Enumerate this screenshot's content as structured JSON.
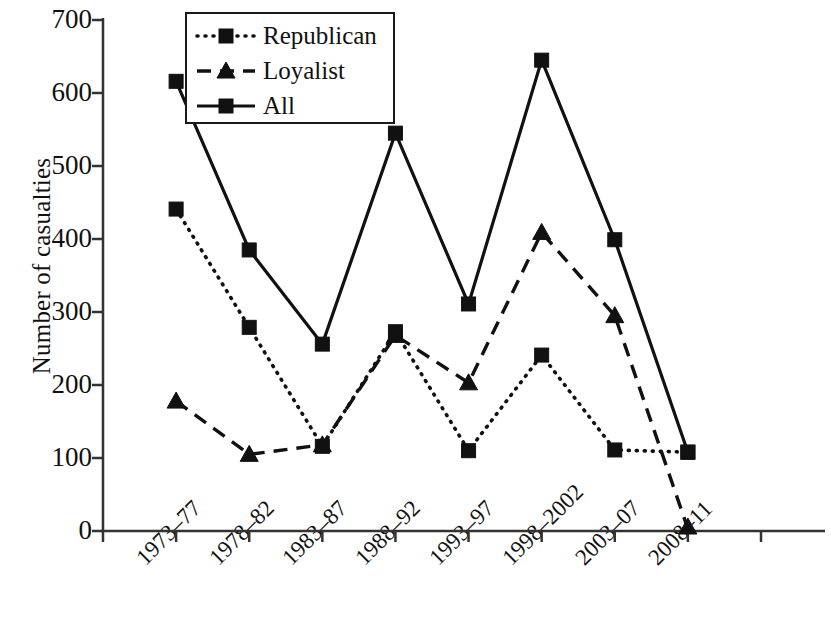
{
  "chart_data": {
    "type": "line",
    "title": "",
    "xlabel": "",
    "ylabel": "Number of casualties",
    "ylim": [
      0,
      700
    ],
    "ytick_values": [
      0,
      100,
      200,
      300,
      400,
      500,
      600,
      700
    ],
    "ytick_labels": [
      "0",
      "100",
      "200",
      "300",
      "400",
      "500",
      "600",
      "700"
    ],
    "grid": false,
    "legend_position": "top-left-inside",
    "categories": [
      "1973–77",
      "1978–82",
      "1983–87",
      "1988–92",
      "1993–97",
      "1998–2002",
      "2003–07",
      "2008–11"
    ],
    "series": [
      {
        "name": "Republican",
        "style": "dotted",
        "marker": "square",
        "color": "#111111",
        "values": [
          441,
          279,
          116,
          273,
          110,
          241,
          111,
          108
        ]
      },
      {
        "name": "Loyalist",
        "style": "dashed",
        "marker": "triangle",
        "color": "#111111",
        "values": [
          178,
          105,
          118,
          268,
          203,
          409,
          295,
          3
        ]
      },
      {
        "name": "All",
        "style": "solid",
        "marker": "square",
        "color": "#111111",
        "values": [
          616,
          385,
          256,
          545,
          311,
          645,
          399,
          108
        ]
      }
    ]
  },
  "axes": {
    "ylabel_text": "Number of casualties"
  },
  "legend": {
    "entries": [
      {
        "label": "Republican",
        "style": "dotted",
        "marker": "square"
      },
      {
        "label": "Loyalist",
        "style": "dashed",
        "marker": "triangle"
      },
      {
        "label": "All",
        "style": "solid",
        "marker": "square"
      }
    ]
  }
}
